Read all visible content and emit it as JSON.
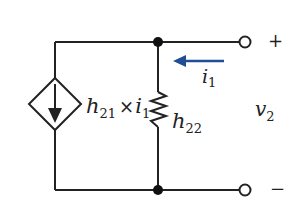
{
  "diagram": {
    "type": "circuit",
    "title": "",
    "colors": {
      "wire": "#222222",
      "current_arrow": "#1f4e96",
      "background": "#ffffff"
    },
    "components": {
      "dependent_source": {
        "kind": "dependent-current-source",
        "label_base": "h",
        "label_sub": "21",
        "label_mult": "×",
        "label_var": "i",
        "label_var_sub": "1",
        "direction": "down"
      },
      "resistor": {
        "kind": "resistor",
        "label_base": "h",
        "label_sub": "22"
      }
    },
    "current": {
      "label_base": "i",
      "label_sub": "1",
      "direction": "left"
    },
    "terminals": {
      "positive": "+",
      "negative": "−"
    },
    "voltage": {
      "label_base": "v",
      "label_sub": "2"
    }
  }
}
